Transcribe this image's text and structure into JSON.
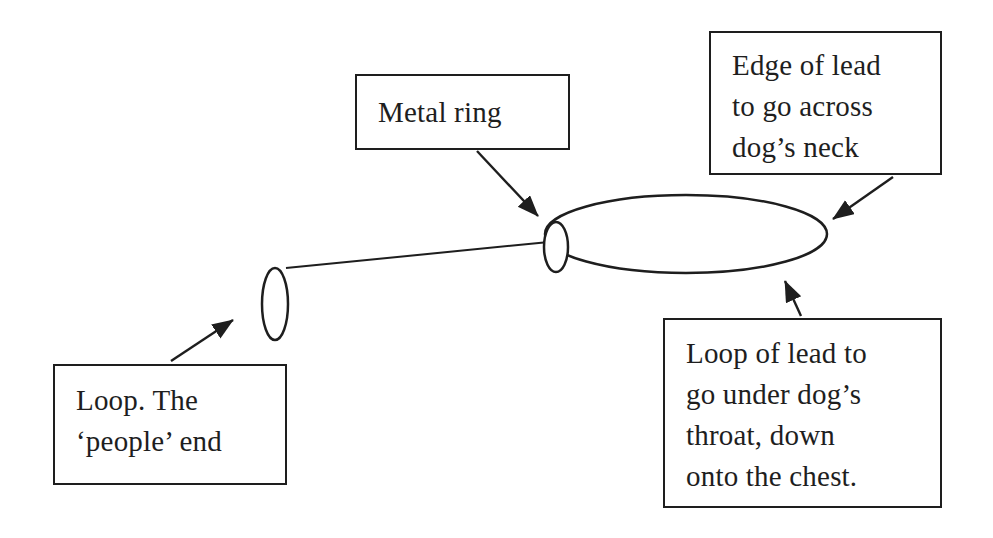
{
  "diagram": {
    "colors": {
      "ink": "#1e1e1e",
      "background": "#ffffff"
    }
  },
  "boxes": {
    "metal_ring": {
      "lines": [
        "Metal ring"
      ]
    },
    "edge": {
      "lines": [
        "Edge of lead",
        "to go across",
        "dog’s neck"
      ]
    },
    "people": {
      "lines": [
        "Loop. The",
        "‘people’ end"
      ]
    },
    "loop": {
      "lines": [
        "Loop of lead to",
        "go under dog’s",
        "throat, down",
        "onto the chest."
      ]
    }
  },
  "shapes": {
    "neck_loop": {
      "cx": 686,
      "cy": 234,
      "rx": 141,
      "ry": 39
    },
    "metal_ring": {
      "cx": 556,
      "cy": 247,
      "rx": 12,
      "ry": 25
    },
    "people_loop": {
      "cx": 275,
      "cy": 304,
      "rx": 13,
      "ry": 36
    }
  }
}
